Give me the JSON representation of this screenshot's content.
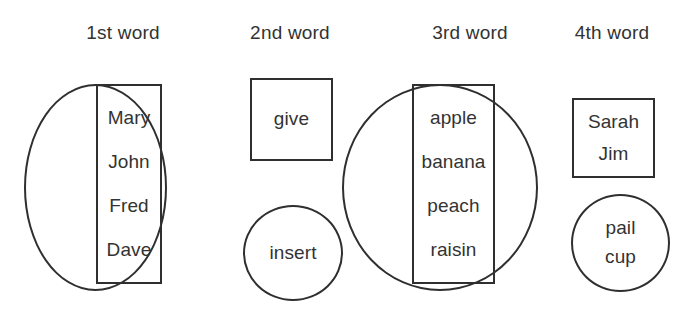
{
  "diagram": {
    "title_row": {
      "headers": [
        {
          "label": "1st word",
          "x": 78,
          "y": 22,
          "width": 90
        },
        {
          "label": "2nd word",
          "x": 242,
          "y": 22,
          "width": 96
        },
        {
          "label": "3rd word",
          "x": 424,
          "y": 22,
          "width": 92
        },
        {
          "label": "4th word",
          "x": 565,
          "y": 22,
          "width": 94
        }
      ]
    },
    "stroke_color": "#2f2f2f",
    "text_color": "#333333",
    "background_color": "#ffffff",
    "columns": [
      {
        "name": "first-word",
        "header": "1st word",
        "outer_shape": "circle",
        "outer": {
          "x": 24,
          "y": 84,
          "w": 143,
          "h": 207
        },
        "inner_shape": "rectangle",
        "inner": {
          "x": 96,
          "y": 84,
          "w": 66,
          "h": 200
        },
        "words": [
          "Mary",
          "John",
          "Fred",
          "Dave"
        ],
        "secondary_shape": null,
        "secondary_words": []
      },
      {
        "name": "second-word",
        "header": "2nd word",
        "outer_shape": "rectangle",
        "outer": {
          "x": 250,
          "y": 78,
          "w": 83,
          "h": 83
        },
        "inner_shape": null,
        "inner": null,
        "words": [
          "give"
        ],
        "secondary_shape": "circle",
        "secondary": {
          "x": 243,
          "y": 205,
          "w": 100,
          "h": 96
        },
        "secondary_words": [
          "insert"
        ]
      },
      {
        "name": "third-word",
        "header": "3rd word",
        "outer_shape": "circle",
        "outer": {
          "x": 342,
          "y": 84,
          "w": 196,
          "h": 207
        },
        "inner_shape": "rectangle",
        "inner": {
          "x": 412,
          "y": 84,
          "w": 83,
          "h": 200
        },
        "words": [
          "apple",
          "banana",
          "peach",
          "raisin"
        ],
        "secondary_shape": null,
        "secondary_words": []
      },
      {
        "name": "fourth-word",
        "header": "4th word",
        "outer_shape": "rectangle",
        "outer": {
          "x": 572,
          "y": 98,
          "w": 83,
          "h": 80
        },
        "inner_shape": null,
        "inner": null,
        "words": [
          "Sarah",
          "Jim"
        ],
        "secondary_shape": "circle",
        "secondary": {
          "x": 571,
          "y": 194,
          "w": 99,
          "h": 98
        },
        "secondary_words": [
          "pail",
          "cup"
        ]
      }
    ]
  }
}
